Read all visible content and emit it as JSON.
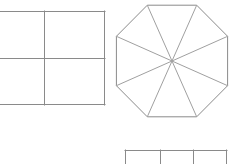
{
  "canvas": {
    "width": 235,
    "height": 164,
    "background_color": "#ffffff",
    "description": "Line drawing of three partitioned geometric figures on a white background"
  },
  "style": {
    "stroke_color": "#8a8a8a",
    "stroke_color_light": "#a0a0a0",
    "stroke_width": 1,
    "fill": "none"
  },
  "shapes": {
    "square": {
      "name": "square-divided-into-four",
      "type": "rectangle",
      "partitions": 4,
      "note": "left edge cropped by image boundary",
      "bounds": {
        "left": 0,
        "top": 11,
        "right": 105,
        "bottom": 105
      },
      "outline_points": "0,11 105,11 105,105 0,105",
      "divider_vertical_x": 44,
      "divider_horizontal_y": 58
    },
    "octagon": {
      "name": "octagon-divided-into-eight-triangles",
      "type": "regular-polygon",
      "sides": 8,
      "partitions": 8,
      "center_x": 172,
      "center_y": 61,
      "radius": 56,
      "rotation_deg": 22.5,
      "bounds": {
        "left": 118,
        "top": 5,
        "right": 226,
        "bottom": 117
      },
      "vertices": [
        [
          147.3,
          5.2
        ],
        [
          196.7,
          5.2
        ],
        [
          227.6,
          36.3
        ],
        [
          227.6,
          85.7
        ],
        [
          196.7,
          116.8
        ],
        [
          147.3,
          116.8
        ],
        [
          116.4,
          85.7
        ],
        [
          116.4,
          36.3
        ]
      ]
    },
    "strip": {
      "name": "rectangle-divided-into-three",
      "type": "rectangle",
      "partitions": 3,
      "note": "bottom edge cropped by image boundary",
      "bounds": {
        "left": 125,
        "top": 150,
        "right": 227,
        "bottom": 164
      },
      "divider_x_positions": [
        160,
        193
      ]
    }
  }
}
